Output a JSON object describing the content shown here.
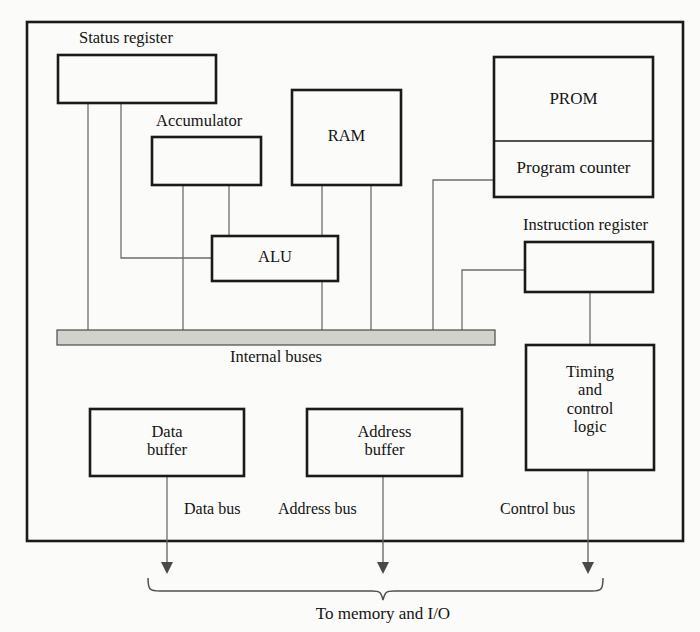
{
  "diagram": {
    "caption": "To memory and I/O",
    "colors": {
      "line": "#1a1a1a",
      "thin_line": "#6a6a6a",
      "bus_fill": "#d2d2cd",
      "background": "#fbfbf9"
    },
    "blocks": [
      {
        "id": "status_register",
        "label": "Status register",
        "label_position": "above"
      },
      {
        "id": "accumulator",
        "label": "Accumulator",
        "label_position": "above"
      },
      {
        "id": "ram",
        "label": "RAM",
        "label_position": "inside"
      },
      {
        "id": "prom",
        "label": "PROM",
        "label_position": "inside"
      },
      {
        "id": "program_counter",
        "label": "Program counter",
        "label_position": "inside"
      },
      {
        "id": "instruction_register",
        "label": "Instruction register",
        "label_position": "above"
      },
      {
        "id": "alu",
        "label": "ALU",
        "label_position": "inside"
      },
      {
        "id": "timing_control_logic",
        "label": "Timing\nand\ncontrol\nlogic",
        "label_position": "inside"
      },
      {
        "id": "data_buffer",
        "label": "Data\nbuffer",
        "label_position": "inside"
      },
      {
        "id": "address_buffer",
        "label": "Address\nbuffer",
        "label_position": "inside"
      }
    ],
    "buses": {
      "internal": "Internal buses",
      "external": [
        {
          "id": "data_bus",
          "label": "Data bus"
        },
        {
          "id": "address_bus",
          "label": "Address bus"
        },
        {
          "id": "control_bus",
          "label": "Control bus"
        }
      ]
    }
  }
}
